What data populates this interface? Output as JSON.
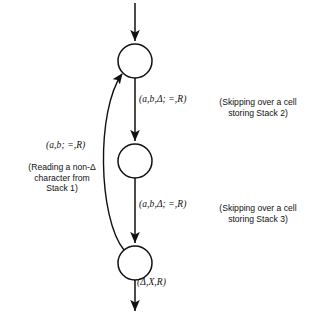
{
  "figure": {
    "type": "state-transition-diagram",
    "background_color": "#ffffff",
    "stroke_color": "#111111"
  },
  "states": [
    {
      "id": "state-top",
      "cx": 135,
      "cy": 61,
      "r": 17
    },
    {
      "id": "state-middle",
      "cx": 135,
      "cy": 161,
      "r": 17
    },
    {
      "id": "state-bottom",
      "cx": 135,
      "cy": 263,
      "r": 17
    }
  ],
  "edges": {
    "entry": {
      "name": "entry-arrow",
      "label": ""
    },
    "top_to_middle": {
      "name": "top-to-middle-arrow",
      "label": "(a,b,Δ; =,R)"
    },
    "middle_to_bottom": {
      "name": "middle-to-bottom-arrow",
      "label": "(a,b,Δ; =,R)"
    },
    "exit": {
      "name": "exit-arrow",
      "label": "(Δ,X,R)"
    },
    "feedback": {
      "name": "feedback-arrow",
      "label": "(a,b; =,R)"
    }
  },
  "annotations": {
    "stack1": "(Reading a non-Δ\ncharacter from\nStack 1)",
    "stack2": "(Skipping over a cell\nstoring Stack 2)",
    "stack3": "(Skipping over a cell\nstoring Stack 3)"
  }
}
